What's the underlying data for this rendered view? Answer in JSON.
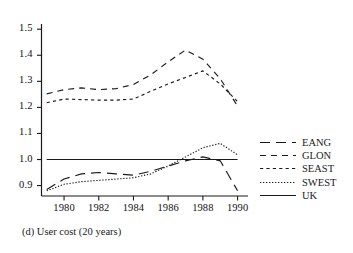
{
  "caption": "(d) User cost  (20 years)",
  "chart_data": {
    "type": "line",
    "title": "",
    "subtitle": "",
    "xlabel": "",
    "ylabel": "",
    "xlim": [
      1978.7,
      1990.6
    ],
    "ylim": [
      0.86,
      1.52
    ],
    "grid": false,
    "legend_position": "right",
    "xticks": [
      1980,
      1982,
      1984,
      1986,
      1988,
      1990
    ],
    "xtick_labels": [
      "1980",
      "1982",
      "1984",
      "1986",
      "1988",
      "1990"
    ],
    "yticks": [
      0.9,
      1.0,
      1.1,
      1.2,
      1.3,
      1.4,
      1.5
    ],
    "ytick_labels": [
      "0.9",
      "1.0",
      "1.1",
      "1.2",
      "1.3",
      "1.4",
      "1.5"
    ],
    "x": [
      1979,
      1980,
      1981,
      1982,
      1983,
      1984,
      1985,
      1986,
      1987,
      1988,
      1989,
      1990
    ],
    "series": [
      {
        "name": "EANG",
        "style": "long-dash",
        "color": "#1a1a1a",
        "values": [
          0.885,
          0.925,
          0.945,
          0.95,
          0.945,
          0.94,
          0.955,
          0.975,
          0.995,
          1.01,
          0.995,
          0.88
        ]
      },
      {
        "name": "GLON",
        "style": "dash",
        "color": "#1a1a1a",
        "values": [
          1.252,
          1.268,
          1.275,
          1.268,
          1.272,
          1.288,
          1.325,
          1.375,
          1.42,
          1.385,
          1.31,
          1.205
        ]
      },
      {
        "name": "SEAST",
        "style": "short-dash",
        "color": "#1a1a1a",
        "values": [
          1.218,
          1.232,
          1.23,
          1.228,
          1.228,
          1.232,
          1.262,
          1.29,
          1.315,
          1.34,
          1.29,
          1.222
        ]
      },
      {
        "name": "SWEST",
        "style": "dotted",
        "color": "#1a1a1a",
        "values": [
          0.88,
          0.905,
          0.915,
          0.92,
          0.925,
          0.93,
          0.945,
          0.975,
          1.01,
          1.045,
          1.062,
          1.018
        ]
      },
      {
        "name": "UK",
        "style": "solid",
        "color": "#1a1a1a",
        "values": [
          1.0,
          1.0,
          1.0,
          1.0,
          1.0,
          1.0,
          1.0,
          1.0,
          1.0,
          1.0,
          1.0,
          1.0
        ]
      }
    ]
  }
}
